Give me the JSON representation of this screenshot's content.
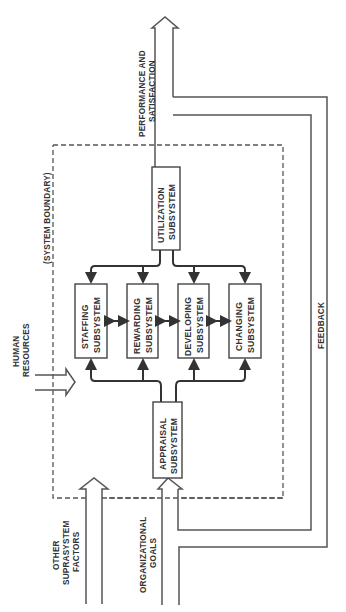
{
  "diagram": {
    "orientation": "rotated-90-ccw",
    "outputs": {
      "performance_label_line1": "PERFORMANCE AND",
      "performance_label_line2": "SATISFACTION"
    },
    "inputs": {
      "human_resources_line1": "HUMAN",
      "human_resources_line2": "RESOURCES",
      "other_line1": "OTHER",
      "other_line2": "SUPRASYSTEM",
      "other_line3": "FACTORS",
      "goals_line1": "ORGANIZATIONAL",
      "goals_line2": "GOALS"
    },
    "boundary_label": "(SYSTEM BOUNDARY)",
    "feedback_label": "FEEDBACK",
    "subsystems": {
      "utilization": {
        "line1": "UTILIZATION",
        "line2": "SUBSYSTEM"
      },
      "staffing": {
        "line1": "STAFFING",
        "line2": "SUBSYSTEM"
      },
      "rewarding": {
        "line1": "REWARDING",
        "line2": "SUBSYSTEM"
      },
      "developing": {
        "line1": "DEVELOPING",
        "line2": "SUBSYSTEM"
      },
      "changing": {
        "line1": "CHANGING",
        "line2": "SUBSYSTEM"
      },
      "appraisal": {
        "line1": "APPRAISAL",
        "line2": "SUBSYSTEM"
      }
    },
    "colors": {
      "line": "#555555",
      "text": "#333333",
      "background": "#ffffff"
    }
  }
}
